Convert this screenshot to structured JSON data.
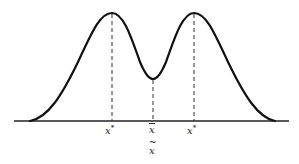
{
  "diagram": {
    "type": "bimodal-distribution",
    "colors": {
      "curve": "#111111",
      "axis": "#222222",
      "dashes": "#333333",
      "background": "#ffffff"
    },
    "labels": {
      "left_mode": {
        "base": "x",
        "sup": "*"
      },
      "mean": {
        "base": "x",
        "accent": "bar"
      },
      "right_mode": {
        "base": "x",
        "sup": "*"
      },
      "median": {
        "base": "x",
        "accent": "~"
      }
    }
  }
}
